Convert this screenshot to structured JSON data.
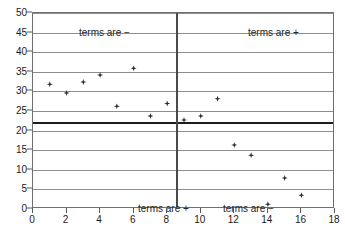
{
  "chart_data": {
    "type": "scatter",
    "title": "",
    "xlabel": "",
    "ylabel": "",
    "xlim": [
      0,
      18
    ],
    "ylim": [
      0,
      50
    ],
    "xticks": [
      0,
      2,
      4,
      6,
      8,
      10,
      12,
      14,
      16,
      18
    ],
    "yticks": [
      0,
      5,
      10,
      15,
      20,
      25,
      30,
      35,
      40,
      45,
      50
    ],
    "grid": true,
    "legend": null,
    "x": [
      1,
      2,
      3,
      4,
      5,
      6,
      7,
      8,
      9,
      10,
      11,
      12,
      13,
      14,
      15,
      16
    ],
    "values": [
      31.8,
      29.6,
      32.4,
      34.2,
      26.2,
      35.9,
      23.7,
      26.9,
      22.7,
      23.7,
      28.1,
      16.3,
      13.7,
      1.2,
      7.9,
      3.5
    ],
    "points": [
      {
        "x": 1,
        "y": 31.8
      },
      {
        "x": 2,
        "y": 29.6
      },
      {
        "x": 3,
        "y": 32.4
      },
      {
        "x": 4,
        "y": 34.2
      },
      {
        "x": 5,
        "y": 26.2
      },
      {
        "x": 6,
        "y": 35.9
      },
      {
        "x": 7,
        "y": 23.7
      },
      {
        "x": 8,
        "y": 26.9
      },
      {
        "x": 9,
        "y": 22.7
      },
      {
        "x": 10,
        "y": 23.7
      },
      {
        "x": 11,
        "y": 28.1
      },
      {
        "x": 12,
        "y": 16.3
      },
      {
        "x": 13,
        "y": 13.7
      },
      {
        "x": 14,
        "y": 1.2
      },
      {
        "x": 15,
        "y": 7.9
      },
      {
        "x": 16,
        "y": 3.5
      }
    ],
    "reference_lines": [
      {
        "orientation": "horizontal",
        "value": 22.3,
        "color": "#1c1c1c"
      },
      {
        "orientation": "vertical",
        "value": 8.5,
        "color": "#4a4a4a"
      }
    ],
    "annotations": [
      {
        "id": "top-left",
        "text": "terms are −",
        "quadrant": "top-left"
      },
      {
        "id": "top-right",
        "text": "terms are +",
        "quadrant": "top-right"
      },
      {
        "id": "bottom-left",
        "text": "terms are +",
        "quadrant": "bottom-left"
      },
      {
        "id": "bottom-right",
        "text": "terms are −",
        "quadrant": "bottom-right"
      }
    ]
  },
  "axes": {
    "y_tick_labels": [
      "50",
      "45",
      "40",
      "35",
      "30",
      "25",
      "20",
      "15",
      "10",
      "5",
      "0"
    ],
    "x_tick_labels": [
      "0",
      "2",
      "4",
      "6",
      "8",
      "10",
      "12",
      "14",
      "16",
      "18"
    ]
  },
  "colors": {
    "marker": "#2b2b2b",
    "gridline": "#8d8d8d",
    "mean_line": "#1c1c1c",
    "divider_line": "#4a4a4a",
    "frame": "#6f6f6f",
    "background": "#ffffff",
    "text": "#1a1a1a"
  }
}
